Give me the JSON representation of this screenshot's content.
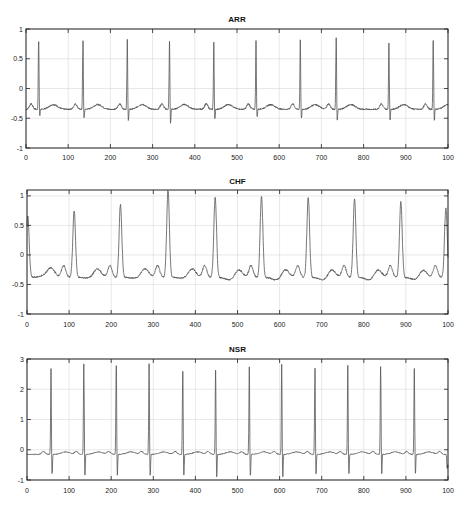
{
  "figure": {
    "background": "#ffffff",
    "line_color": "#555555",
    "grid_color": "#d9d9d9",
    "axis_color": "#222222"
  },
  "chart_data": [
    {
      "type": "line",
      "title": "ARR",
      "xlabel": "",
      "ylabel": "",
      "xlim": [
        0,
        1000
      ],
      "ylim": [
        -1,
        1
      ],
      "xticks": [
        0,
        100,
        200,
        300,
        400,
        500,
        600,
        700,
        800,
        900,
        1000
      ],
      "xtick_labels": [
        "0",
        "100",
        "200",
        "300",
        "400",
        "500",
        "600",
        "700",
        "800",
        "900",
        "100"
      ],
      "yticks": [
        1,
        0.5,
        0,
        -0.5,
        -1
      ],
      "ytick_labels": [
        "1",
        "0.5",
        "0",
        "-0.5",
        "-1"
      ],
      "grid": true,
      "baseline": -0.35,
      "beat_style": "sharp",
      "peaks": [
        {
          "x": 30,
          "y": 0.78,
          "s": -0.48
        },
        {
          "x": 135,
          "y": 0.8,
          "s": -0.52
        },
        {
          "x": 240,
          "y": 0.82,
          "s": -0.55
        },
        {
          "x": 340,
          "y": 0.79,
          "s": -0.6
        },
        {
          "x": 445,
          "y": 0.78,
          "s": -0.52
        },
        {
          "x": 545,
          "y": 0.8,
          "s": -0.5
        },
        {
          "x": 650,
          "y": 0.83,
          "s": -0.52
        },
        {
          "x": 735,
          "y": 0.85,
          "s": -0.55
        },
        {
          "x": 860,
          "y": 0.78,
          "s": -0.55
        },
        {
          "x": 965,
          "y": 0.8,
          "s": -0.55
        }
      ]
    },
    {
      "type": "line",
      "title": "CHF",
      "xlabel": "",
      "ylabel": "",
      "xlim": [
        0,
        1000
      ],
      "ylim": [
        -1,
        1.1
      ],
      "xticks": [
        0,
        100,
        200,
        300,
        400,
        500,
        600,
        700,
        800,
        900,
        1000
      ],
      "xtick_labels": [
        "0",
        "100",
        "200",
        "300",
        "400",
        "500",
        "600",
        "700",
        "800",
        "900",
        "100"
      ],
      "yticks": [
        1,
        0.5,
        0,
        -0.5,
        -1
      ],
      "ytick_labels": [
        "1",
        "0.5",
        "0",
        "-0.5",
        "-1"
      ],
      "grid": true,
      "baseline": -0.38,
      "beat_style": "wide",
      "peaks": [
        {
          "x": 2,
          "y": 0.65,
          "s": -0.35
        },
        {
          "x": 112,
          "y": 0.75,
          "s": -0.4
        },
        {
          "x": 222,
          "y": 0.85,
          "s": -0.4
        },
        {
          "x": 335,
          "y": 1.1,
          "s": -0.4
        },
        {
          "x": 447,
          "y": 0.98,
          "s": -0.45
        },
        {
          "x": 557,
          "y": 1.0,
          "s": -0.45
        },
        {
          "x": 668,
          "y": 0.98,
          "s": -0.45
        },
        {
          "x": 778,
          "y": 0.95,
          "s": -0.45
        },
        {
          "x": 888,
          "y": 0.9,
          "s": -0.45
        },
        {
          "x": 995,
          "y": 0.8,
          "s": -0.45
        }
      ]
    },
    {
      "type": "line",
      "title": "NSR",
      "xlabel": "",
      "ylabel": "",
      "xlim": [
        0,
        1000
      ],
      "ylim": [
        -1,
        3
      ],
      "xticks": [
        0,
        100,
        200,
        300,
        400,
        500,
        600,
        700,
        800,
        900,
        1000
      ],
      "xtick_labels": [
        "0",
        "100",
        "200",
        "300",
        "400",
        "500",
        "600",
        "700",
        "800",
        "900",
        "100"
      ],
      "yticks": [
        3,
        2,
        1,
        0,
        -1
      ],
      "ytick_labels": [
        "3",
        "2",
        "1",
        "0",
        "-1"
      ],
      "grid": true,
      "baseline": -0.15,
      "beat_style": "sharp",
      "peaks": [
        {
          "x": 57,
          "y": 2.7,
          "s": -0.85
        },
        {
          "x": 135,
          "y": 2.85,
          "s": -0.9
        },
        {
          "x": 212,
          "y": 2.8,
          "s": -0.9
        },
        {
          "x": 290,
          "y": 2.85,
          "s": -0.9
        },
        {
          "x": 370,
          "y": 2.6,
          "s": -0.9
        },
        {
          "x": 448,
          "y": 2.65,
          "s": -0.95
        },
        {
          "x": 528,
          "y": 2.75,
          "s": -0.9
        },
        {
          "x": 605,
          "y": 2.85,
          "s": -0.95
        },
        {
          "x": 684,
          "y": 2.7,
          "s": -0.85
        },
        {
          "x": 762,
          "y": 2.8,
          "s": -0.85
        },
        {
          "x": 840,
          "y": 2.75,
          "s": -0.85
        },
        {
          "x": 920,
          "y": 2.7,
          "s": -0.85
        },
        {
          "x": 998,
          "y": -0.6,
          "s": -0.6
        }
      ]
    }
  ],
  "layout": [
    {
      "left": 26,
      "right": 448,
      "top": 29,
      "bottom": 148,
      "title_y": 22,
      "ticks_y": 160
    },
    {
      "left": 27,
      "right": 448,
      "top": 190,
      "bottom": 314,
      "title_y": 184,
      "ticks_y": 327
    },
    {
      "left": 27,
      "right": 448,
      "top": 359,
      "bottom": 480,
      "title_y": 352,
      "ticks_y": 493
    }
  ]
}
